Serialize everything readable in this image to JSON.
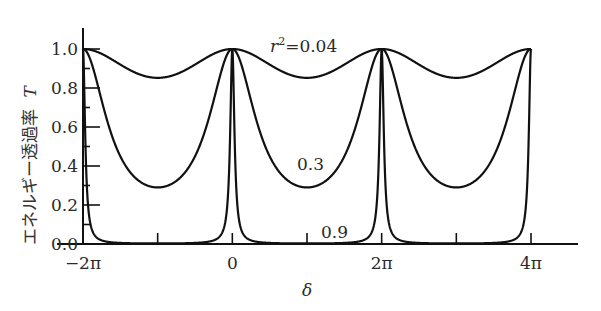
{
  "chart_data": {
    "type": "line",
    "title": "",
    "xlabel": "δ",
    "ylabel": "エネルギー透過率 T",
    "ylabel_text": "エネルギー透過率",
    "ylabel_symbol": "T",
    "xlim": [
      -6.2832,
      12.5664
    ],
    "ylim": [
      0.0,
      1.0
    ],
    "x_ticks": [
      {
        "value": -6.2832,
        "label": "−2π",
        "major": true
      },
      {
        "value": -3.1416,
        "label": "",
        "major": false
      },
      {
        "value": 0,
        "label": "0",
        "major": true
      },
      {
        "value": 3.1416,
        "label": "",
        "major": false
      },
      {
        "value": 6.2832,
        "label": "2π",
        "major": true
      },
      {
        "value": 9.4248,
        "label": "",
        "major": false
      },
      {
        "value": 12.5664,
        "label": "4π",
        "major": true
      }
    ],
    "y_ticks": [
      {
        "value": 0.0,
        "label": "0.0"
      },
      {
        "value": 0.1,
        "label": ""
      },
      {
        "value": 0.2,
        "label": "0.2"
      },
      {
        "value": 0.3,
        "label": ""
      },
      {
        "value": 0.4,
        "label": "0.4"
      },
      {
        "value": 0.5,
        "label": ""
      },
      {
        "value": 0.6,
        "label": "0.6"
      },
      {
        "value": 0.7,
        "label": ""
      },
      {
        "value": 0.8,
        "label": "0.8"
      },
      {
        "value": 0.9,
        "label": ""
      },
      {
        "value": 1.0,
        "label": "1.0"
      }
    ],
    "grid": false,
    "legend": null,
    "formula": "T = (1 - r^2)^2 / (1 + r^4 - 2 r^2 cos δ)",
    "series": [
      {
        "name": "r²=0.04",
        "r2": 0.04,
        "label": "r²=0.04",
        "peak": 1.0,
        "min": 0.852
      },
      {
        "name": "0.3",
        "r2": 0.3,
        "label": "0.3",
        "peak": 1.0,
        "min": 0.29
      },
      {
        "name": "0.9",
        "r2": 0.9,
        "label": "0.9",
        "peak": 1.0,
        "min": 0.003
      }
    ],
    "annotations": [
      {
        "text_prefix": "r",
        "text_sup": "2",
        "text_suffix": "=0.04",
        "x": 1.2,
        "y": 1.0
      },
      {
        "text": "0.3",
        "x": 3.6,
        "y": 0.4
      },
      {
        "text": "0.9",
        "x": 4.3,
        "y": 0.05
      }
    ]
  }
}
